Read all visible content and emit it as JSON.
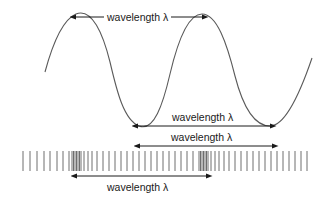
{
  "figure": {
    "background_color": "#ffffff",
    "wave_color": "#5a5a5a",
    "arrow_color": "#1a1a1a",
    "barcode_color": "#6e6e6e",
    "lambda_symbol": "λ"
  },
  "labels": {
    "top": "wavelength λ",
    "second": "wavelength λ",
    "third": "wavelength λ",
    "bottom": "wavelength λ"
  },
  "wave": {
    "start_x": 45,
    "start_y": 72,
    "peak1_x": 76,
    "peak1_y": 14,
    "trough1_x": 139,
    "trough1_y": 126,
    "peak2_x": 202,
    "peak2_y": 14,
    "trough2_x": 270,
    "trough2_y": 126,
    "end_x": 312,
    "end_y": 58
  },
  "measurements": [
    {
      "name": "peak-to-peak",
      "x1": 76,
      "x2": 202,
      "y": 17
    },
    {
      "name": "trough-to-trough",
      "x1": 138,
      "x2": 270,
      "y": 126
    },
    {
      "name": "barcode-upper",
      "x1": 140,
      "x2": 272,
      "y": 146
    },
    {
      "name": "barcode-lower",
      "x1": 77,
      "x2": 206,
      "y": 176
    }
  ],
  "barcode": {
    "top_y": 151,
    "bottom_y": 171,
    "left_x": 23,
    "right_x": 307,
    "line_positions": [
      23,
      30,
      37,
      44,
      50,
      57,
      63,
      69,
      72,
      73.5,
      75,
      76.5,
      78,
      79.5,
      81,
      84,
      88,
      92,
      97,
      103,
      109,
      115,
      121,
      127,
      133,
      139,
      145,
      151,
      157,
      163,
      169,
      175,
      181,
      187,
      193,
      199,
      200.5,
      202,
      203.5,
      205,
      206.5,
      208,
      211,
      215,
      219,
      224,
      229,
      235,
      241,
      247,
      253,
      259,
      265,
      271,
      277,
      283,
      289,
      295,
      301,
      307
    ]
  }
}
